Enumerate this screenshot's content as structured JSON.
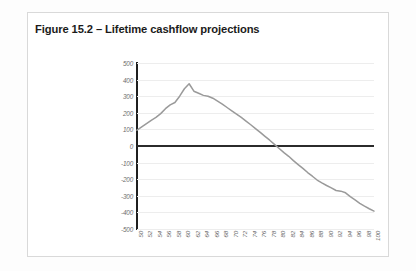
{
  "card": {
    "title": "Figure 15.2 – Lifetime cashflow projections"
  },
  "chart_data": {
    "type": "line",
    "title": "Figure 15.2 – Lifetime cashflow projections",
    "xlabel": "",
    "ylabel": "",
    "xlim": [
      50,
      100
    ],
    "ylim": [
      -500,
      500
    ],
    "ytick_step": 100,
    "xtick_step": 2,
    "grid": true,
    "legend": "none",
    "zero_line": true,
    "line_color": "#9a9a9a",
    "ytick_labels": [
      "500",
      "400",
      "300",
      "200",
      "100",
      "0",
      "-100",
      "-200",
      "-300",
      "-400",
      "-500"
    ],
    "yticks": [
      500,
      400,
      300,
      200,
      100,
      0,
      -100,
      -200,
      -300,
      -400,
      -500
    ],
    "xtick_labels": [
      "50",
      "52",
      "54",
      "56",
      "58",
      "60",
      "62",
      "64",
      "66",
      "68",
      "70",
      "72",
      "74",
      "76",
      "78",
      "80",
      "82",
      "84",
      "86",
      "88",
      "90",
      "92",
      "94",
      "96",
      "98",
      "100"
    ],
    "xticks": [
      50,
      52,
      54,
      56,
      58,
      60,
      62,
      64,
      66,
      68,
      70,
      72,
      74,
      76,
      78,
      80,
      82,
      84,
      86,
      88,
      90,
      92,
      94,
      96,
      98,
      100
    ],
    "x": [
      50,
      51,
      52,
      53,
      54,
      55,
      56,
      57,
      58,
      59,
      60,
      61,
      62,
      63,
      64,
      65,
      66,
      67,
      68,
      69,
      70,
      71,
      72,
      73,
      74,
      75,
      76,
      77,
      78,
      79,
      80,
      81,
      82,
      83,
      84,
      85,
      86,
      87,
      88,
      89,
      90,
      91,
      92,
      93,
      94,
      95,
      96,
      97,
      98,
      99,
      100
    ],
    "values": [
      95,
      115,
      135,
      155,
      172,
      195,
      225,
      248,
      262,
      300,
      345,
      375,
      330,
      318,
      305,
      300,
      288,
      270,
      252,
      232,
      212,
      192,
      172,
      150,
      128,
      105,
      82,
      58,
      35,
      10,
      -15,
      -40,
      -62,
      -88,
      -112,
      -135,
      -160,
      -182,
      -205,
      -222,
      -238,
      -252,
      -268,
      -272,
      -282,
      -305,
      -325,
      -345,
      -362,
      -378,
      -392
    ],
    "series": [
      {
        "name": "Lifetime cashflow",
        "values": [
          95,
          115,
          135,
          155,
          172,
          195,
          225,
          248,
          262,
          300,
          345,
          375,
          330,
          318,
          305,
          300,
          288,
          270,
          252,
          232,
          212,
          192,
          172,
          150,
          128,
          105,
          82,
          58,
          35,
          10,
          -15,
          -40,
          -62,
          -88,
          -112,
          -135,
          -160,
          -182,
          -205,
          -222,
          -238,
          -252,
          -268,
          -272,
          -282,
          -305,
          -325,
          -345,
          -362,
          -378,
          -392
        ]
      }
    ]
  }
}
